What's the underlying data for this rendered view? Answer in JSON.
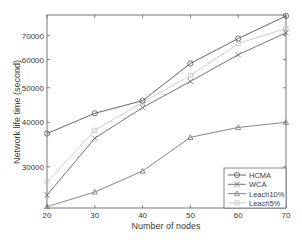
{
  "chart_data": {
    "type": "line",
    "title": "",
    "xlabel": "Number of nodes",
    "ylabel": "Network life time (second)",
    "x": [
      20,
      30,
      40,
      50,
      60,
      70
    ],
    "xlim": [
      20,
      70
    ],
    "ylim": [
      23000,
      80000
    ],
    "yscale": "log",
    "xticks": [
      20,
      30,
      40,
      50,
      60,
      70
    ],
    "yticks": [
      30000,
      40000,
      50000,
      60000,
      70000
    ],
    "ytick_labels": [
      "30000",
      "40000",
      "50000",
      "60000",
      "70000"
    ],
    "xtick_labels": [
      "20",
      "30",
      "40",
      "50",
      "60",
      "70"
    ],
    "grid": false,
    "legend_position": "lower right",
    "series": [
      {
        "name": "HCMA",
        "marker": "circle",
        "color": "#555555",
        "values": [
          37200,
          42400,
          46000,
          58500,
          68700,
          79500
        ]
      },
      {
        "name": "WCA",
        "marker": "x",
        "color": "#666666",
        "values": [
          25000,
          36100,
          44000,
          52100,
          61900,
          71300
        ]
      },
      {
        "name": "Leach10%",
        "marker": "triangle",
        "color": "#777777",
        "values": [
          23200,
          25500,
          29200,
          36300,
          38700,
          40000
        ]
      },
      {
        "name": "Leach5%",
        "marker": "square",
        "color": "#c8c8c8",
        "values": [
          27200,
          38000,
          45500,
          54100,
          66500,
          73300
        ]
      }
    ]
  }
}
